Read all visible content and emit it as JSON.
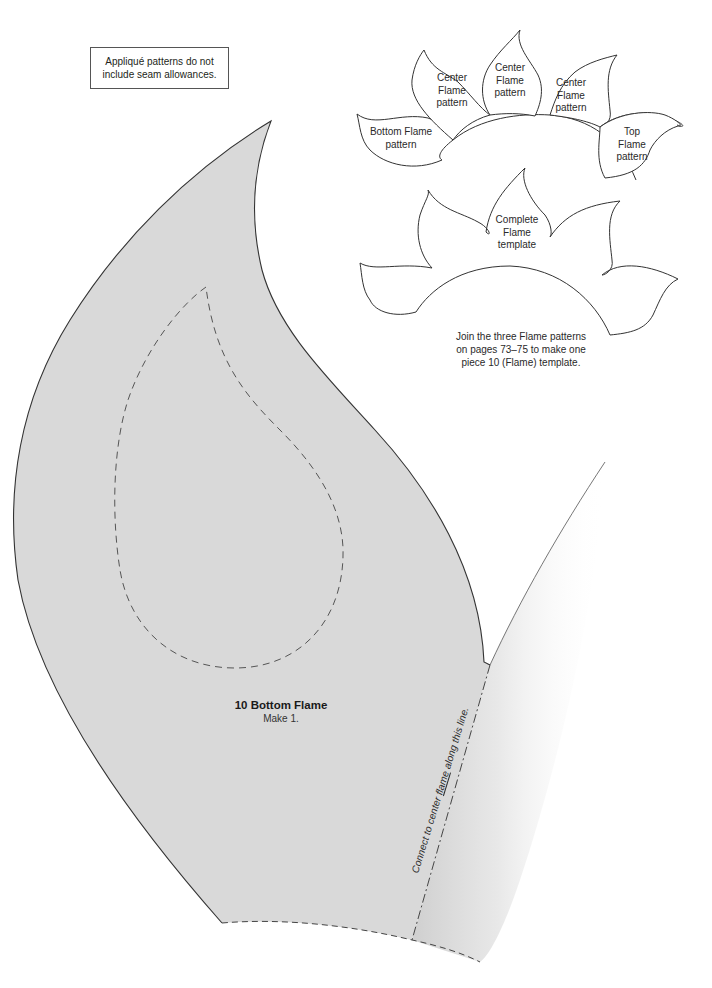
{
  "note": {
    "line1": "Appliqué patterns do not",
    "line2": "include seam allowances."
  },
  "diagram": {
    "labels": [
      {
        "id": "center-left",
        "lines": [
          "Center",
          "Flame",
          "pattern"
        ]
      },
      {
        "id": "center-middle",
        "lines": [
          "Center",
          "Flame",
          "pattern"
        ]
      },
      {
        "id": "center-right",
        "lines": [
          "Center",
          "Flame",
          "pattern"
        ]
      },
      {
        "id": "bottom",
        "lines": [
          "Bottom Flame",
          "pattern"
        ]
      },
      {
        "id": "top",
        "lines": [
          "Top",
          "Flame",
          "pattern"
        ]
      },
      {
        "id": "complete",
        "lines": [
          "Complete",
          "Flame",
          "template"
        ]
      }
    ],
    "join_note": {
      "line1": "Join the three Flame patterns",
      "line2": "on pages 73–75 to make one",
      "line3": "piece 10 (Flame) template."
    }
  },
  "piece": {
    "name": "10 Bottom Flame",
    "quantity": "Make 1.",
    "connect_line_text_before": "Connect to center ",
    "connect_line_text_emph": "flame",
    "connect_line_text_after": " along this line.",
    "fill_color": "#d9d9d9",
    "outline_color": "#333333"
  }
}
